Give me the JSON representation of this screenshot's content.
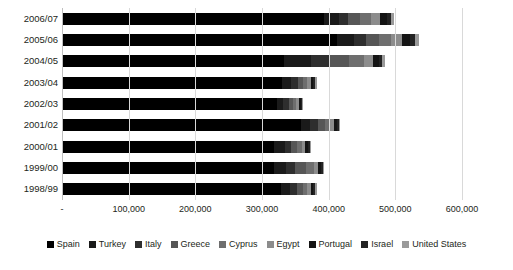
{
  "chart_data": {
    "type": "bar",
    "orientation": "horizontal",
    "stacked": true,
    "title": "",
    "subtitle": "",
    "xlabel": "",
    "ylabel": "",
    "grid": true,
    "legend_position": "bottom",
    "xlim": [
      0,
      600000
    ],
    "xticks": [
      0,
      100000,
      200000,
      300000,
      400000,
      500000,
      600000
    ],
    "xtick_labels": [
      "-",
      "100,000",
      "200,000",
      "300,000",
      "400,000",
      "500,000",
      "600,000"
    ],
    "categories": [
      "2006/07",
      "2005/06",
      "2004/05",
      "2003/04",
      "2002/03",
      "2001/02",
      "2000/01",
      "1999/00",
      "1998/99"
    ],
    "series": [
      {
        "name": "Spain",
        "color": "#000000",
        "values": [
          393000,
          412000,
          333000,
          330000,
          322000,
          358000,
          318000,
          318000,
          328000
        ]
      },
      {
        "name": "Turkey",
        "color": "#1a1a1a",
        "values": [
          22000,
          26000,
          40000,
          14000,
          10000,
          14000,
          16000,
          18000,
          14000
        ]
      },
      {
        "name": "Italy",
        "color": "#2e2e2e",
        "values": [
          14000,
          18000,
          28000,
          10000,
          8000,
          12000,
          10000,
          14000,
          10000
        ]
      },
      {
        "name": "Greece",
        "color": "#565656",
        "values": [
          18000,
          20000,
          30000,
          8000,
          6000,
          10000,
          9000,
          16000,
          9000
        ]
      },
      {
        "name": "Cyprus",
        "color": "#6e6e6e",
        "values": [
          16000,
          18000,
          22000,
          6000,
          5000,
          8000,
          7000,
          12000,
          7000
        ]
      },
      {
        "name": "Egypt",
        "color": "#8c8c8c",
        "values": [
          14000,
          16000,
          14000,
          5000,
          4000,
          6000,
          5000,
          6000,
          5000
        ]
      },
      {
        "name": "Portugal",
        "color": "#141414",
        "values": [
          10000,
          12000,
          8000,
          4000,
          3000,
          4000,
          4000,
          4000,
          4000
        ]
      },
      {
        "name": "Israel",
        "color": "#232323",
        "values": [
          6000,
          8000,
          5000,
          3000,
          2000,
          3000,
          3000,
          3000,
          3000
        ]
      },
      {
        "name": "United States",
        "color": "#9a9a9a",
        "values": [
          5000,
          6000,
          4000,
          2000,
          2000,
          2000,
          2000,
          2000,
          2000
        ]
      }
    ]
  }
}
